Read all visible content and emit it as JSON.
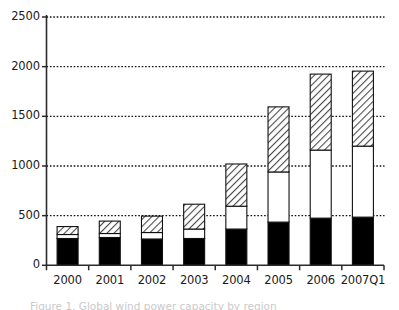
{
  "figure": {
    "caption": "Figure 1. Global wind power capacity by region",
    "background_color": "#ffffff",
    "axis_color": "#1a1a1a"
  },
  "chart_data": {
    "type": "bar",
    "stacked": true,
    "title": "",
    "xlabel": "",
    "ylabel": "",
    "ylim": [
      0,
      2500
    ],
    "yticks": [
      0,
      500,
      1000,
      1500,
      2000,
      2500
    ],
    "ytick_labels": [
      "0",
      "500",
      "1000",
      "1500",
      "2000",
      "2500"
    ],
    "grid": "horizontal-dotted",
    "legend": "none",
    "categories": [
      "2000",
      "2001",
      "2002",
      "2003",
      "2004",
      "2005",
      "2006",
      "2007Q1"
    ],
    "series": [
      {
        "name": "bottom-segment",
        "fill": "solid-black",
        "color": "#000000",
        "values": [
          270,
          280,
          265,
          270,
          365,
          435,
          475,
          485
        ]
      },
      {
        "name": "middle-segment",
        "fill": "white",
        "color": "#ffffff",
        "values": [
          40,
          40,
          65,
          95,
          230,
          505,
          685,
          715
        ]
      },
      {
        "name": "top-segment",
        "fill": "diagonal-hatch",
        "color": "#d9d9d9",
        "values": [
          80,
          125,
          165,
          250,
          425,
          655,
          765,
          755
        ]
      }
    ],
    "totals": [
      390,
      445,
      495,
      615,
      1020,
      1595,
      1925,
      1955
    ]
  }
}
